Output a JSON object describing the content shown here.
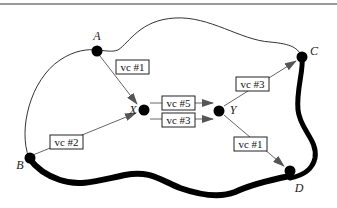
{
  "diagram": {
    "type": "network-virtual-circuits",
    "colors": {
      "boundary": "#222222",
      "thick_path": "#000000",
      "node": "#000000",
      "arrow_line": "#666666",
      "arrow_head": "#555555",
      "box_border": "#222222",
      "top_rule": "#777777"
    },
    "nodes": {
      "A": {
        "label": "A"
      },
      "B": {
        "label": "B"
      },
      "C": {
        "label": "C"
      },
      "D": {
        "label": "D"
      },
      "X": {
        "label": "X"
      },
      "Y": {
        "label": "Y"
      }
    },
    "edges": [
      {
        "from": "A",
        "to": "X",
        "label": "vc #1"
      },
      {
        "from": "B",
        "to": "X",
        "label": "vc #2"
      },
      {
        "from": "X",
        "to": "Y",
        "label": "vc #5"
      },
      {
        "from": "X",
        "to": "Y",
        "label": "vc #3"
      },
      {
        "from": "Y",
        "to": "C",
        "label": "vc #3"
      },
      {
        "from": "Y",
        "to": "D",
        "label": "vc #1"
      }
    ]
  }
}
